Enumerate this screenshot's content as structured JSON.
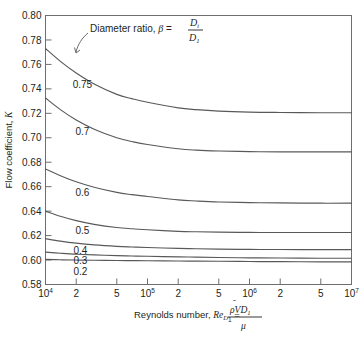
{
  "chart_data": {
    "type": "line",
    "title": "",
    "xlabel": "Reynolds number, Re_D1 = rho Vbar D1 / mu",
    "ylabel": "Flow coefficient, K",
    "xscale": "log",
    "xlim": [
      10000,
      10000000
    ],
    "ylim": [
      0.58,
      0.8
    ],
    "grid": false,
    "legend": "inline-curve-labels",
    "annotation": "Diameter ratio, beta = Dt / D1",
    "ytick_labels": [
      "0.58",
      "0.60",
      "0.62",
      "0.64",
      "0.66",
      "0.68",
      "0.70",
      "0.72",
      "0.74",
      "0.76",
      "0.78",
      "0.80"
    ],
    "ytick_values": [
      0.58,
      0.6,
      0.62,
      0.64,
      0.66,
      0.68,
      0.7,
      0.72,
      0.74,
      0.76,
      0.78,
      0.8
    ],
    "xtick_values": [
      10000,
      20000,
      50000,
      100000,
      200000,
      500000,
      1000000,
      2000000,
      5000000,
      10000000
    ],
    "xtick_labels": [
      "10⁴",
      "2",
      "5",
      "10⁵",
      "2",
      "5",
      "10⁶",
      "2",
      "5",
      "10⁷"
    ],
    "x": [
      10000,
      14000,
      20000,
      30000,
      50000,
      70000,
      100000,
      200000,
      300000,
      500000,
      1000000,
      2000000,
      5000000,
      10000000
    ],
    "series": [
      {
        "name": "0.75",
        "label": "0.75",
        "values": [
          0.773,
          0.7625,
          0.753,
          0.744,
          0.7355,
          0.732,
          0.729,
          0.7245,
          0.723,
          0.7218,
          0.721,
          0.7207,
          0.7205,
          0.7205
        ]
      },
      {
        "name": "0.7",
        "label": "0.7",
        "values": [
          0.7325,
          0.723,
          0.7145,
          0.707,
          0.7,
          0.697,
          0.6945,
          0.691,
          0.6899,
          0.6892,
          0.6887,
          0.6885,
          0.6885,
          0.6885
        ]
      },
      {
        "name": "0.6",
        "label": "0.6",
        "values": [
          0.6745,
          0.669,
          0.664,
          0.6595,
          0.6553,
          0.6535,
          0.652,
          0.6492,
          0.6483,
          0.6475,
          0.647,
          0.6467,
          0.6465,
          0.6465
        ]
      },
      {
        "name": "0.5",
        "label": "0.5",
        "values": [
          0.64,
          0.6358,
          0.6322,
          0.6292,
          0.6266,
          0.6256,
          0.6248,
          0.6235,
          0.6231,
          0.6228,
          0.6226,
          0.6225,
          0.6225,
          0.6225
        ]
      },
      {
        "name": "0.4",
        "label": "0.4",
        "values": [
          0.6175,
          0.6155,
          0.6138,
          0.6124,
          0.6112,
          0.6107,
          0.6103,
          0.6095,
          0.6092,
          0.6089,
          0.6087,
          0.6086,
          0.6085,
          0.6085
        ]
      },
      {
        "name": "0.3",
        "label": "0.3",
        "values": [
          0.6065,
          0.6056,
          0.6048,
          0.6042,
          0.6036,
          0.6033,
          0.6031,
          0.6026,
          0.6024,
          0.6021,
          0.6018,
          0.6017,
          0.6015,
          0.6015
        ]
      },
      {
        "name": "0.2",
        "label": "0.2",
        "values": [
          0.6005,
          0.6002,
          0.6,
          0.5998,
          0.5996,
          0.5995,
          0.5994,
          0.5992,
          0.5991,
          0.599,
          0.5988,
          0.5987,
          0.5985,
          0.5985
        ]
      }
    ]
  },
  "labels": {
    "y_axis_title_a": "Flow coefficient, ",
    "y_axis_title_k": "K",
    "x_axis_title_a": "Reynolds number, ",
    "x_axis_title_re": "Re",
    "x_axis_title_re_sub": "D",
    "x_axis_title_re_sub2": "1",
    "x_axis_title_eq": "=",
    "x_frac_num_rho": "ρ",
    "x_frac_num_v": "V",
    "x_frac_num_d": "D",
    "x_frac_num_d_sub": "1",
    "x_frac_den": "μ",
    "annotation_text": "Diameter ratio, ",
    "annotation_beta": "β",
    "annotation_eq": " = ",
    "annotation_num": "D",
    "annotation_num_sub": "t",
    "annotation_den": "D",
    "annotation_den_sub": "1"
  },
  "ytick_labels": [
    "0.80",
    "0.78",
    "0.76",
    "0.74",
    "0.72",
    "0.70",
    "0.68",
    "0.66",
    "0.64",
    "0.62",
    "0.60",
    "0.58"
  ],
  "xtick_labels": [
    {
      "text": "10",
      "sup": "4"
    },
    {
      "text": "2",
      "sup": ""
    },
    {
      "text": "5",
      "sup": ""
    },
    {
      "text": "10",
      "sup": "5"
    },
    {
      "text": "2",
      "sup": ""
    },
    {
      "text": "5",
      "sup": ""
    },
    {
      "text": "10",
      "sup": "6"
    },
    {
      "text": "2",
      "sup": ""
    },
    {
      "text": "5",
      "sup": ""
    },
    {
      "text": "10",
      "sup": "7"
    }
  ],
  "curve_labels": [
    "0.75",
    "0.7",
    "0.6",
    "0.5",
    "0.4",
    "0.3",
    "0.2"
  ],
  "colors": {
    "curve": "#58595b",
    "frame": "#6d6e71",
    "text": "#231f20",
    "background": "#ffffff"
  }
}
